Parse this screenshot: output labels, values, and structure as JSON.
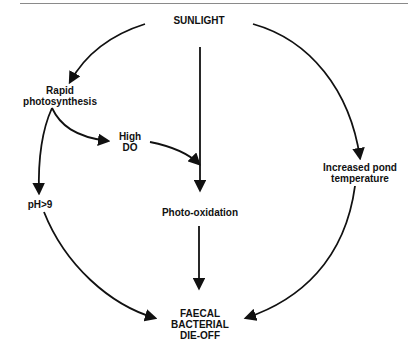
{
  "diagram": {
    "nodes": {
      "sunlight": "SUNLIGHT",
      "rapid_photosynthesis_line1": "Rapid",
      "rapid_photosynthesis_line2": "photosynthesis",
      "high_do_line1": "High",
      "high_do_line2": "DO",
      "ph": "pH>9",
      "photo_oxidation": "Photo-oxidation",
      "increased_temp_line1": "Increased pond",
      "increased_temp_line2": "temperature",
      "dieoff_line1": "FAECAL",
      "dieoff_line2": "BACTERIAL",
      "dieoff_line3": "DIE-OFF"
    },
    "edges": [
      {
        "from": "SUNLIGHT",
        "to": "Rapid photosynthesis"
      },
      {
        "from": "SUNLIGHT",
        "to": "Photo-oxidation"
      },
      {
        "from": "SUNLIGHT",
        "to": "Increased pond temperature"
      },
      {
        "from": "Rapid photosynthesis",
        "to": "High DO"
      },
      {
        "from": "Rapid photosynthesis",
        "to": "pH>9"
      },
      {
        "from": "High DO",
        "to": "Photo-oxidation"
      },
      {
        "from": "pH>9",
        "to": "FAECAL BACTERIAL DIE-OFF"
      },
      {
        "from": "Photo-oxidation",
        "to": "FAECAL BACTERIAL DIE-OFF"
      },
      {
        "from": "Increased pond temperature",
        "to": "FAECAL BACTERIAL DIE-OFF"
      }
    ]
  }
}
